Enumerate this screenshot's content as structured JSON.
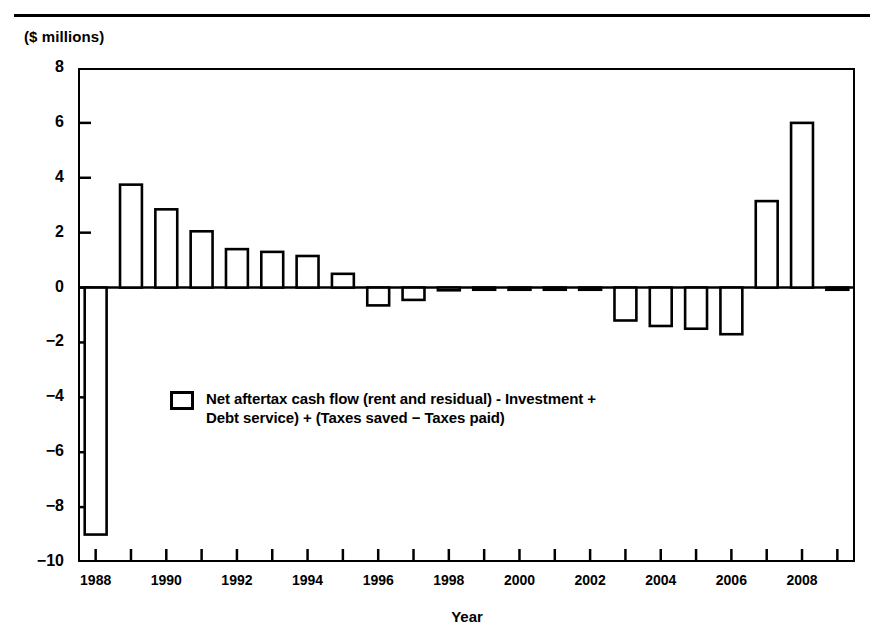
{
  "figure": {
    "unit_label": "($ millions)",
    "xlabel": "Year"
  },
  "legend": {
    "label": "Net aftertax cash flow (rent and residual) - Investment +\nDebt service) + (Taxes saved − Taxes paid)"
  },
  "chart_data": {
    "type": "bar",
    "title": "",
    "xlabel": "Year",
    "ylabel": "($ millions)",
    "ylim": [
      -10,
      8
    ],
    "xlim": [
      1987.5,
      2009.5
    ],
    "yticks": [
      8,
      6,
      4,
      2,
      0,
      -2,
      -4,
      -6,
      -8,
      -10
    ],
    "ytick_labels": [
      "8",
      "6",
      "4",
      "2",
      "0",
      "−2",
      "−4",
      "−6",
      "−8",
      "−10"
    ],
    "xticks": [
      1988,
      1990,
      1992,
      1994,
      1996,
      1998,
      2000,
      2002,
      2004,
      2006,
      2008
    ],
    "xtick_labels": [
      "1988",
      "1990",
      "1992",
      "1994",
      "1996",
      "1998",
      "2000",
      "2002",
      "2004",
      "2006",
      "2008"
    ],
    "xminor_every": 1,
    "grid": false,
    "legend_position": "inside-lower-left",
    "bar_style": "open (white fill, black outline)",
    "categories": [
      1988,
      1989,
      1990,
      1991,
      1992,
      1993,
      1994,
      1995,
      1996,
      1997,
      1998,
      1999,
      2000,
      2001,
      2002,
      2003,
      2004,
      2005,
      2006,
      2007,
      2008,
      2009
    ],
    "values": [
      -9.0,
      3.75,
      2.85,
      2.05,
      1.4,
      1.3,
      1.15,
      0.5,
      -0.65,
      -0.45,
      -0.1,
      -0.05,
      -0.05,
      -0.05,
      -0.05,
      -1.2,
      -1.4,
      -1.5,
      -1.7,
      3.15,
      6.0,
      -0.08
    ],
    "series": [
      {
        "name": "Net aftertax cash flow (rent and residual) - Investment + Debt service) + (Taxes saved − Taxes paid)",
        "values": [
          -9.0,
          3.75,
          2.85,
          2.05,
          1.4,
          1.3,
          1.15,
          0.5,
          -0.65,
          -0.45,
          -0.1,
          -0.05,
          -0.05,
          -0.05,
          -0.05,
          -1.2,
          -1.4,
          -1.5,
          -1.7,
          3.15,
          6.0,
          -0.08
        ]
      }
    ]
  }
}
